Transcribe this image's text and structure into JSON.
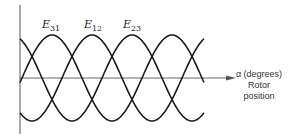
{
  "diagram": {
    "type": "three-phase waveform",
    "curves": [
      {
        "name": "E31",
        "letter": "E",
        "subscript": "31",
        "peak_x": 52
      },
      {
        "name": "E12",
        "letter": "E",
        "subscript": "12",
        "peak_x": 92
      },
      {
        "name": "E23",
        "letter": "E",
        "subscript": "23",
        "peak_x": 132
      }
    ],
    "x_axis": {
      "line1": "α (degrees)",
      "line2": "Rotor",
      "line3": "position"
    },
    "colors": {
      "curve": "#1a1a1a",
      "axis": "#555555"
    }
  }
}
